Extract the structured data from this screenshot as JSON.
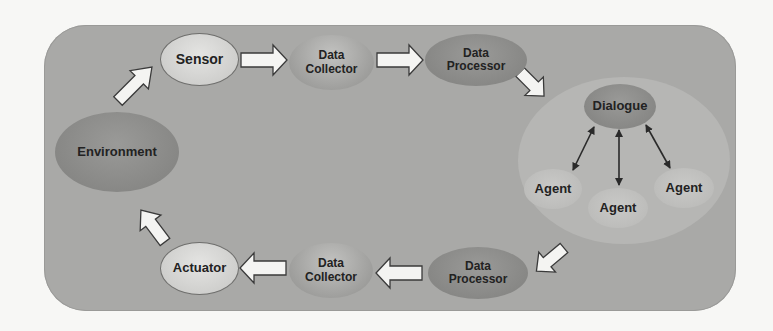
{
  "diagram": {
    "type": "closed-loop flow",
    "nodes": {
      "environment": "Environment",
      "sensor": "Sensor",
      "data_collector_top": "Data\nCollector",
      "data_processor_top": "Data\nProcessor",
      "dialogue": "Dialogue",
      "agent_left": "Agent",
      "agent_center": "Agent",
      "agent_right": "Agent",
      "data_processor_bottom": "Data\nProcessor",
      "data_collector_bottom": "Data\nCollector",
      "actuator": "Actuator"
    },
    "edges": [
      {
        "from": "Environment",
        "to": "Sensor",
        "style": "block-arrow"
      },
      {
        "from": "Sensor",
        "to": "Data Collector",
        "style": "block-arrow"
      },
      {
        "from": "Data Collector",
        "to": "Data Processor",
        "style": "block-arrow"
      },
      {
        "from": "Data Processor",
        "to": "Dialogue cluster",
        "style": "block-arrow"
      },
      {
        "from": "Dialogue",
        "to": "Agent (left)",
        "style": "double-headed"
      },
      {
        "from": "Dialogue",
        "to": "Agent (center)",
        "style": "double-headed"
      },
      {
        "from": "Dialogue",
        "to": "Agent (right)",
        "style": "double-headed"
      },
      {
        "from": "Dialogue cluster",
        "to": "Data Processor",
        "style": "block-arrow"
      },
      {
        "from": "Data Processor",
        "to": "Data Collector",
        "style": "block-arrow"
      },
      {
        "from": "Data Collector",
        "to": "Actuator",
        "style": "block-arrow"
      },
      {
        "from": "Actuator",
        "to": "Environment",
        "style": "block-arrow"
      }
    ],
    "colors": {
      "frame": "#a9a9a7",
      "cluster": "#b6b6b4",
      "arrow_fill": "#f4f4f2",
      "arrow_stroke": "#3a3a3a",
      "text": "#222222"
    }
  }
}
